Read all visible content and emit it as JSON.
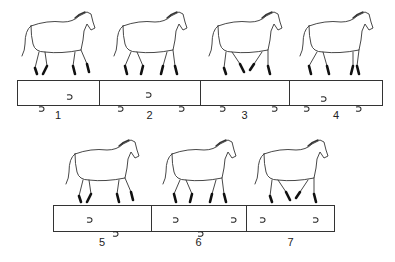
{
  "figure": {
    "rows": [
      {
        "frames": [
          {
            "label": "1",
            "box": [
              17,
              99
            ],
            "prints": [
              [
                48,
                5
              ],
              [
                20,
                17
              ]
            ]
          },
          {
            "label": "2",
            "box": [
              99,
              200
            ],
            "prints": [
              [
                45,
                3
              ],
              [
                17,
                17
              ],
              [
                78,
                17
              ]
            ]
          },
          {
            "label": "3",
            "box": [
              200,
              289
            ],
            "prints": [
              [
                18,
                17
              ],
              [
                70,
                17
              ]
            ]
          },
          {
            "label": "4",
            "box": [
              289,
              383
            ],
            "prints": [
              [
                30,
                7
              ],
              [
                13,
                17
              ],
              [
                65,
                17
              ]
            ]
          }
        ]
      },
      {
        "frames": [
          {
            "label": "5",
            "box": [
              53,
              151
            ],
            "prints": [
              [
                32,
                3
              ],
              [
                58,
                17
              ]
            ]
          },
          {
            "label": "6",
            "box": [
              151,
              246
            ],
            "prints": [
              [
                20,
                3
              ],
              [
                78,
                3
              ],
              [
                45,
                17
              ]
            ]
          },
          {
            "label": "7",
            "box": [
              246,
              335
            ],
            "prints": [
              [
                12,
                3
              ],
              [
                65,
                3
              ]
            ]
          }
        ]
      }
    ]
  }
}
